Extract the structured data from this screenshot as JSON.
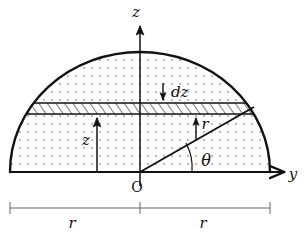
{
  "figure": {
    "background_color": "#ffffff",
    "stroke_color": "#111111",
    "fill_dot_color": "#555555",
    "hatch_color": "#111111",
    "width": 308,
    "height": 241
  },
  "axes": {
    "vertical": {
      "label": "z",
      "name": "z-axis",
      "x": 140,
      "y_top": 22,
      "y_bottom": 186,
      "label_x": 137,
      "label_y": 16
    },
    "horizontal": {
      "label": "y",
      "name": "y-axis",
      "y": 172,
      "x_left": 10,
      "x_right": 288,
      "label_x": 292,
      "label_y": 178
    },
    "origin": {
      "label": "O",
      "x": 140,
      "y": 172,
      "label_x": 133,
      "label_y": 190
    }
  },
  "shape": {
    "type": "semicircle",
    "center_x": 140,
    "baseline_y": 172,
    "radius_x": 130,
    "radius_y": 120,
    "top_y": 52,
    "left_x": 10,
    "right_x": 270
  },
  "slab": {
    "name": "differential-disk",
    "top_y": 103,
    "bottom_y": 114,
    "label": "dz",
    "label_x": 172,
    "label_y": 95,
    "arrow_x": 163,
    "arrow_from_y": 84,
    "arrow_to_y": 102
  },
  "height_marker": {
    "label": "z",
    "x": 97,
    "from_y": 172,
    "to_y": 115,
    "label_x": 86,
    "label_y": 143
  },
  "radius_marker": {
    "label": "r",
    "name": "radial-line",
    "from_x": 140,
    "from_y": 172,
    "to_x": 252,
    "to_y": 108,
    "arrow_x": 196,
    "arrow_from_y": 141,
    "arrow_to_y": 116,
    "label_x": 203,
    "label_y": 127
  },
  "angle_marker": {
    "label": "θ",
    "name": "theta-angle",
    "vertex_x": 140,
    "vertex_y": 172,
    "arc_radius": 52,
    "label_x": 204,
    "label_y": 164
  },
  "dimension_bar": {
    "y": 208,
    "x_left": 10,
    "x_center": 140,
    "x_right": 270,
    "tick_half_height": 6,
    "left_label": "r",
    "right_label": "r",
    "left_label_x": 72,
    "right_label_x": 202,
    "label_y": 226
  }
}
